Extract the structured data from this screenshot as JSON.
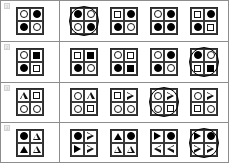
{
  "sheet": {
    "title": "Visual analogy matrix test sheet",
    "row_count": 4,
    "option_count": 4,
    "colors": {
      "ink": "#000000",
      "grid_line": "#3a3a3a",
      "panel_border": "#8d8d8d",
      "paper": "#ffffff",
      "label_chip": "#ededed"
    }
  },
  "rows": [
    {
      "label": "1",
      "selected_option_index": 0,
      "question": {
        "name": "question-matrix",
        "cells": [
          "circle-open",
          "circle-filled",
          "circle-filled",
          "circle-open"
        ]
      },
      "options": [
        {
          "label": "A",
          "selected": true,
          "cells": [
            "circle-filled",
            "circle-open",
            "circle-open",
            "circle-filled"
          ]
        },
        {
          "label": "B",
          "selected": false,
          "cells": [
            "square-open",
            "circle-filled",
            "circle-filled",
            "circle-open"
          ]
        },
        {
          "label": "C",
          "selected": false,
          "cells": [
            "circle-open",
            "circle-filled",
            "circle-filled",
            "circle-filled"
          ]
        },
        {
          "label": "D",
          "selected": false,
          "cells": [
            "square-open",
            "circle-filled",
            "circle-filled",
            "square-open"
          ]
        }
      ]
    },
    {
      "label": "2",
      "selected_option_index": 3,
      "question": {
        "name": "question-matrix",
        "cells": [
          "circle-open",
          "square-filled",
          "circle-filled",
          "square-open"
        ]
      },
      "options": [
        {
          "label": "A",
          "selected": false,
          "cells": [
            "square-open",
            "square-filled",
            "circle-filled",
            "circle-open"
          ]
        },
        {
          "label": "B",
          "selected": false,
          "cells": [
            "circle-open",
            "square-open",
            "circle-filled",
            "square-filled"
          ]
        },
        {
          "label": "C",
          "selected": false,
          "cells": [
            "circle-open",
            "circle-filled",
            "circle-filled",
            "circle-open"
          ]
        },
        {
          "label": "D",
          "selected": true,
          "cells": [
            "circle-filled",
            "circle-open",
            "square-open",
            "square-filled"
          ]
        }
      ]
    },
    {
      "label": "3",
      "selected_option_index": 2,
      "question": {
        "name": "question-matrix",
        "cells": [
          "triangle-open",
          "square-open",
          "circle-open",
          "circle-open"
        ]
      },
      "options": [
        {
          "label": "A",
          "selected": false,
          "cells": [
            "circle-open",
            "triangle-open",
            "circle-open",
            "square-open"
          ]
        },
        {
          "label": "B",
          "selected": false,
          "cells": [
            "square-open",
            "triangle-right-open",
            "circle-open",
            "circle-open"
          ]
        },
        {
          "label": "C",
          "selected": true,
          "cells": [
            "circle-open",
            "triangle-right-open",
            "circle-open",
            "square-open"
          ]
        },
        {
          "label": "D",
          "selected": false,
          "cells": [
            "circle-open",
            "triangle-right-open",
            "square-open",
            "circle-open"
          ]
        }
      ]
    },
    {
      "label": "4",
      "selected_option_index": 3,
      "question": {
        "name": "question-matrix",
        "cells": [
          "circle-filled",
          "triangle-open",
          "triangle-filled",
          "triangle-open"
        ]
      },
      "options": [
        {
          "label": "A",
          "selected": false,
          "cells": [
            "circle-filled",
            "triangle-right-open",
            "triangle-right-filled",
            "triangle-right-open"
          ]
        },
        {
          "label": "B",
          "selected": false,
          "cells": [
            "triangle-filled",
            "circle-filled",
            "triangle-open",
            "triangle-open"
          ]
        },
        {
          "label": "C",
          "selected": false,
          "cells": [
            "triangle-right-filled",
            "circle-filled",
            "triangle-left-open",
            "triangle-left-open"
          ]
        },
        {
          "label": "D",
          "selected": true,
          "cells": [
            "triangle-right-filled",
            "circle-filled",
            "triangle-right-open",
            "triangle-right-open"
          ]
        }
      ]
    }
  ]
}
